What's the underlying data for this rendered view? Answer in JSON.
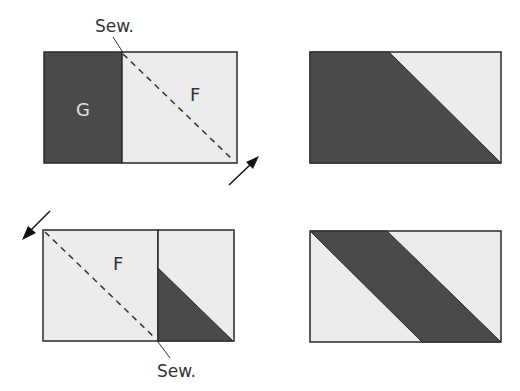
{
  "colors": {
    "dark": "#4a4a4a",
    "light": "#ececec",
    "stroke": "#2a2a2a",
    "label_light": "#e0e0e0",
    "label_dark": "#333333"
  },
  "step1": {
    "label_left": "G",
    "label_right": "F",
    "sew_label": "Sew."
  },
  "step2": {
    "label_left": "F",
    "sew_label": "Sew."
  }
}
